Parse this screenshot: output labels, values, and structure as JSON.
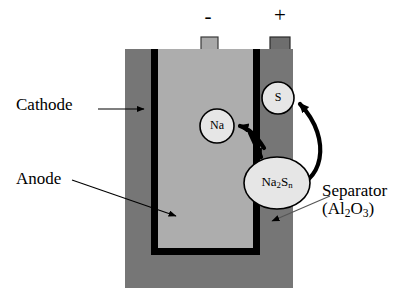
{
  "figure": {
    "type": "diagram",
    "colors": {
      "cathode_fill": "#767676",
      "anode_fill": "#adadad",
      "separator_stroke": "#000000",
      "terminal_minus_fill": "#a8a8a8",
      "terminal_plus_fill": "#6e6e6e",
      "species_fill": "#e2e2e2",
      "background": "#ffffff"
    }
  },
  "terminals": {
    "negative": {
      "sign": "-",
      "name": "negative-terminal"
    },
    "positive": {
      "sign": "+",
      "name": "positive-terminal"
    }
  },
  "labels": {
    "cathode": "Cathode",
    "anode": "Anode",
    "separator_line1": "Separator",
    "separator_line2_pre": "(Al",
    "separator_line2_sub1": "2",
    "separator_line2_mid": "O",
    "separator_line2_sub2": "3",
    "separator_line2_post": ")"
  },
  "species": {
    "sodium": {
      "label": "Na",
      "shape": "circle"
    },
    "sulfur": {
      "label": "S",
      "shape": "circle"
    },
    "polysulfide": {
      "label_pre": "Na",
      "label_sub1": "2",
      "label_mid": "S",
      "label_sub2": "n",
      "shape": "ellipse"
    }
  },
  "arrows": {
    "cathode_pointer": "leader line from Cathode label to cathode body",
    "anode_pointer": "leader line from Anode label to anode interior",
    "separator_pointer": "leader line from Separator label to separator wall",
    "reaction_to_na": "curved arrow from polysulfide toward Na",
    "reaction_to_polysulfide": "curved arrow into polysulfide ellipse",
    "reaction_to_s": "curved arrow from polysulfide up to S"
  }
}
